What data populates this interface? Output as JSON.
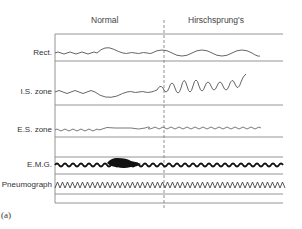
{
  "headers": {
    "normal": "Normal",
    "hirschsprung": "Hirschsprung's"
  },
  "channels": [
    {
      "label": "Rect."
    },
    {
      "label": "I.S. zone"
    },
    {
      "label": "E.S. zone"
    },
    {
      "label": "E.M.G."
    },
    {
      "label": "Pneumograph"
    }
  ],
  "panel_label": "(a)"
}
